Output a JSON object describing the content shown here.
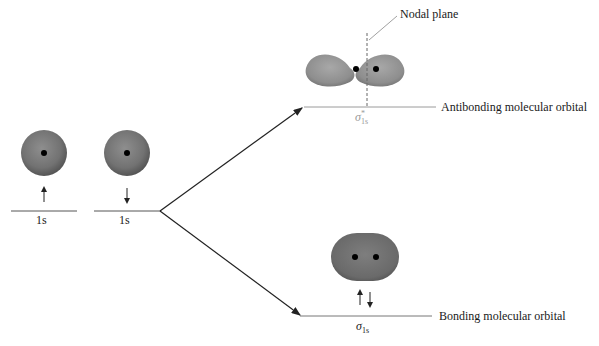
{
  "diagram": {
    "type": "molecular-orbital-energy-diagram",
    "atomic_orbitals": [
      {
        "label": "1s",
        "spin": "up",
        "position": "left"
      },
      {
        "label": "1s",
        "spin": "down",
        "position": "right"
      }
    ],
    "molecular_orbitals": {
      "antibonding": {
        "symbol": "σ",
        "superscript": "*",
        "subscript": "1s",
        "description": "Antibonding molecular orbital",
        "electrons": 0,
        "annotation": "Nodal plane"
      },
      "bonding": {
        "symbol": "σ",
        "subscript": "1s",
        "description": "Bonding molecular orbital",
        "electrons": 2,
        "spins": [
          "up",
          "down"
        ]
      }
    },
    "colors": {
      "orbital_fill": "#8a8a8a",
      "orbital_dark": "#5e5e5e",
      "nucleus": "#000000",
      "line": "#333333",
      "level_line": "#9a9a9a"
    }
  }
}
